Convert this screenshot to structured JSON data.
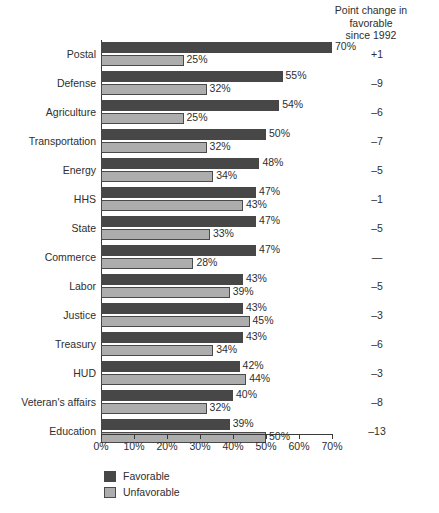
{
  "header": {
    "line1": "Point change in",
    "line2": "favorable",
    "line3": "since 1992"
  },
  "legend": {
    "favorable_label": "Favorable",
    "unfavorable_label": "Unfavorable",
    "favorable_color": "#474747",
    "unfavorable_color": "#adadad"
  },
  "axis": {
    "ticks": [
      "0%",
      "10%",
      "20%",
      "30%",
      "40%",
      "50%",
      "60%",
      "70%"
    ]
  },
  "rows": [
    {
      "category": "Postal",
      "fav": 70,
      "unfav": 25,
      "fav_label": "70%",
      "unfav_label": "25%",
      "change": "+1"
    },
    {
      "category": "Defense",
      "fav": 55,
      "unfav": 32,
      "fav_label": "55%",
      "unfav_label": "32%",
      "change": "–9"
    },
    {
      "category": "Agriculture",
      "fav": 54,
      "unfav": 25,
      "fav_label": "54%",
      "unfav_label": "25%",
      "change": "–6"
    },
    {
      "category": "Transportation",
      "fav": 50,
      "unfav": 32,
      "fav_label": "50%",
      "unfav_label": "32%",
      "change": "–7"
    },
    {
      "category": "Energy",
      "fav": 48,
      "unfav": 34,
      "fav_label": "48%",
      "unfav_label": "34%",
      "change": "–5"
    },
    {
      "category": "HHS",
      "fav": 47,
      "unfav": 43,
      "fav_label": "47%",
      "unfav_label": "43%",
      "change": "–1"
    },
    {
      "category": "State",
      "fav": 47,
      "unfav": 33,
      "fav_label": "47%",
      "unfav_label": "33%",
      "change": "–5"
    },
    {
      "category": "Commerce",
      "fav": 47,
      "unfav": 28,
      "fav_label": "47%",
      "unfav_label": "28%",
      "change": "—"
    },
    {
      "category": "Labor",
      "fav": 43,
      "unfav": 39,
      "fav_label": "43%",
      "unfav_label": "39%",
      "change": "–5"
    },
    {
      "category": "Justice",
      "fav": 43,
      "unfav": 45,
      "fav_label": "43%",
      "unfav_label": "45%",
      "change": "–3"
    },
    {
      "category": "Treasury",
      "fav": 43,
      "unfav": 34,
      "fav_label": "43%",
      "unfav_label": "34%",
      "change": "–6"
    },
    {
      "category": "HUD",
      "fav": 42,
      "unfav": 44,
      "fav_label": "42%",
      "unfav_label": "44%",
      "change": "–3"
    },
    {
      "category": "Veteran's affairs",
      "fav": 40,
      "unfav": 32,
      "fav_label": "40%",
      "unfav_label": "32%",
      "change": "–8"
    },
    {
      "category": "Education",
      "fav": 39,
      "unfav": 50,
      "fav_label": "39%",
      "unfav_label": "50%",
      "change": "–13"
    }
  ],
  "chart_data": {
    "type": "bar",
    "title": "",
    "subtitle": "",
    "orientation": "horizontal",
    "grouped": true,
    "xlabel": "",
    "ylabel": "",
    "xlim": [
      0,
      70
    ],
    "xtick_values": [
      0,
      10,
      20,
      30,
      40,
      50,
      60,
      70
    ],
    "xtick_labels": [
      "0%",
      "10%",
      "20%",
      "30%",
      "40%",
      "50%",
      "60%",
      "70%"
    ],
    "grid": false,
    "legend_position": "bottom-left",
    "legend_entries": [
      "Favorable",
      "Unfavorable"
    ],
    "categories": [
      "Postal",
      "Defense",
      "Agriculture",
      "Transportation",
      "Energy",
      "HHS",
      "State",
      "Commerce",
      "Labor",
      "Justice",
      "Treasury",
      "HUD",
      "Veteran's affairs",
      "Education"
    ],
    "series": [
      {
        "name": "Favorable",
        "color": "#474747",
        "values": [
          70,
          55,
          54,
          50,
          48,
          47,
          47,
          47,
          43,
          43,
          43,
          42,
          40,
          39
        ]
      },
      {
        "name": "Unfavorable",
        "color": "#adadad",
        "values": [
          25,
          32,
          25,
          32,
          34,
          43,
          33,
          28,
          39,
          45,
          34,
          44,
          32,
          50
        ]
      }
    ],
    "annotation_column": {
      "header": "Point change in favorable since 1992",
      "values": [
        "+1",
        "–9",
        "–6",
        "–7",
        "–5",
        "–1",
        "–5",
        "—",
        "–5",
        "–3",
        "–6",
        "–3",
        "–8",
        "–13"
      ]
    }
  }
}
